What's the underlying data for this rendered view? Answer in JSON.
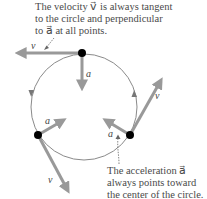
{
  "captions": {
    "top": [
      "The velocity v⃗ is always tangent",
      "to the circle and perpendicular",
      "to a⃗ at all points."
    ],
    "bottom": [
      "The acceleration a⃗",
      "always points toward",
      "the center of the circle."
    ]
  },
  "labels": {
    "velocity": "v⃗",
    "acceleration": "a⃗"
  },
  "colors": {
    "arrow": "#999999",
    "circle": "#888888",
    "dot": "#000000",
    "text": "#4a4a4a"
  },
  "diagram": {
    "circle": {
      "cx": 84,
      "cy": 107,
      "r": 53
    },
    "points": [
      {
        "name": "top",
        "x": 82,
        "y": 53,
        "velocity_to": [
          14,
          53
        ],
        "accel_to": [
          82,
          92
        ]
      },
      {
        "name": "left",
        "x": 38,
        "y": 135,
        "velocity_to": [
          70,
          195
        ],
        "accel_to": [
          67,
          118
        ]
      },
      {
        "name": "right",
        "x": 130,
        "y": 135,
        "velocity_to": [
          164,
          76
        ],
        "accel_to": [
          102,
          118
        ]
      }
    ]
  }
}
